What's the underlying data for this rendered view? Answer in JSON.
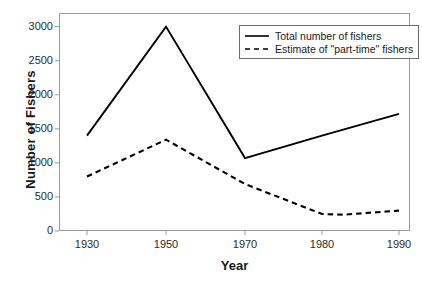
{
  "chart_data": {
    "type": "line",
    "title": "",
    "xlabel": "Year",
    "ylabel": "Number of Fishers",
    "categories": [
      "1930",
      "1950",
      "1970",
      "1980",
      "1990"
    ],
    "xtick_labels": [
      "1930",
      "1950",
      "1970",
      "1980",
      "1990"
    ],
    "ytick_labels": [
      "0",
      "500",
      "1000",
      "1500",
      "2000",
      "2500",
      "3000"
    ],
    "ytick_values": [
      0,
      500,
      1000,
      1500,
      2000,
      2500,
      3000
    ],
    "ylim": [
      0,
      3200
    ],
    "grid": false,
    "legend_position": "top-right",
    "series": [
      {
        "name": "Total number of fishers",
        "style": "solid",
        "color": "#000000",
        "values": [
          1400,
          3000,
          1070,
          1400,
          1720
        ]
      },
      {
        "name": "Estimate of \"part-time\" fishers",
        "style": "dashed",
        "color": "#000000",
        "values": [
          800,
          1340,
          690,
          250,
          300
        ]
      }
    ],
    "annotations": []
  },
  "legend": {
    "items": [
      {
        "label": "Total number of fishers",
        "style": "solid"
      },
      {
        "label": "Estimate of \"part-time\" fishers",
        "style": "dashed"
      }
    ]
  },
  "axes": {
    "x_title": "Year",
    "y_title": "Number of Fishers"
  }
}
